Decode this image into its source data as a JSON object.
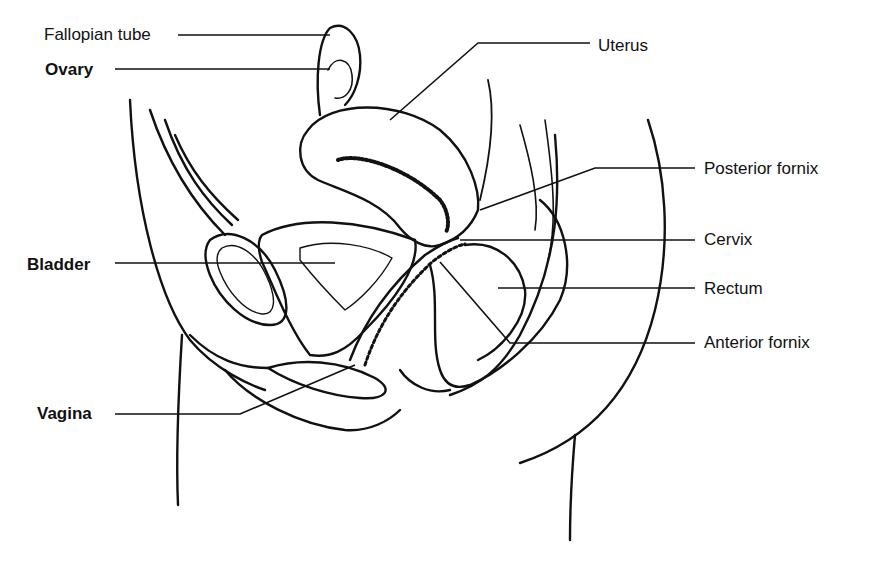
{
  "diagram": {
    "labels": [
      {
        "id": "fallopian-tube",
        "text": "Fallopian tube",
        "x": 44,
        "y": 26,
        "bold": false
      },
      {
        "id": "ovary",
        "text": "Ovary",
        "x": 45,
        "y": 61,
        "bold": true
      },
      {
        "id": "uterus",
        "text": "Uterus",
        "x": 598,
        "y": 37,
        "bold": false
      },
      {
        "id": "posterior-fornix",
        "text": "Posterior fornix",
        "x": 704,
        "y": 160,
        "bold": false
      },
      {
        "id": "cervix",
        "text": "Cervix",
        "x": 704,
        "y": 231,
        "bold": false
      },
      {
        "id": "bladder",
        "text": "Bladder",
        "x": 27,
        "y": 256,
        "bold": true
      },
      {
        "id": "rectum",
        "text": "Rectum",
        "x": 704,
        "y": 280,
        "bold": false
      },
      {
        "id": "anterior-fornix",
        "text": "Anterior fornix",
        "x": 704,
        "y": 334,
        "bold": false
      },
      {
        "id": "vagina",
        "text": "Vagina",
        "x": 37,
        "y": 405,
        "bold": true
      }
    ],
    "leaders": [
      {
        "id": "fallopian-tube",
        "points": "178,35 330,35"
      },
      {
        "id": "ovary",
        "points": "115,69 330,69"
      },
      {
        "id": "uterus",
        "points": "590,43 478,43 390,120"
      },
      {
        "id": "posterior-fornix",
        "points": "695,168 595,168 480,210"
      },
      {
        "id": "cervix",
        "points": "695,240 460,240"
      },
      {
        "id": "bladder",
        "points": "115,263 335,263"
      },
      {
        "id": "rectum",
        "points": "695,288 498,288"
      },
      {
        "id": "anterior-fornix",
        "points": "695,343 510,343 440,262"
      },
      {
        "id": "vagina",
        "points": "115,414 240,414 355,365"
      }
    ]
  }
}
